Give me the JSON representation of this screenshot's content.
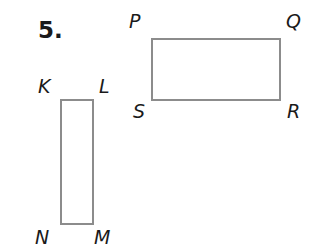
{
  "problem": {
    "number": "5."
  },
  "figures": {
    "rect_pqrs": {
      "vertices": {
        "top_left": "P",
        "top_right": "Q",
        "bottom_right": "R",
        "bottom_left": "S"
      }
    },
    "rect_klmn": {
      "vertices": {
        "top_left": "K",
        "top_right": "L",
        "bottom_right": "M",
        "bottom_left": "N"
      }
    }
  },
  "colors": {
    "stroke": "#8c8c8c",
    "text": "#1a1a1a"
  }
}
